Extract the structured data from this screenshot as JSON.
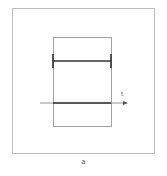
{
  "figure": {
    "caption": "a",
    "axis_label": "t",
    "colors": {
      "frame": "#bdbdbd",
      "inner_rect": "#a0a0a0",
      "error_bar": "#333333",
      "axis": "#555555",
      "axis_segment": "#333333"
    }
  }
}
